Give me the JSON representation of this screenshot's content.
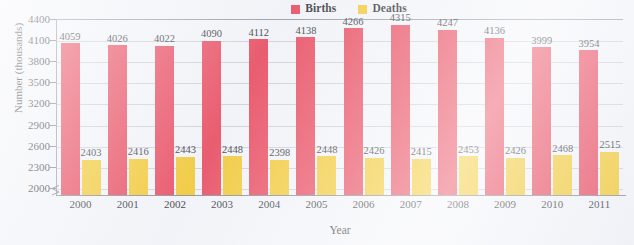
{
  "chart_data": {
    "type": "bar",
    "title": "",
    "xlabel": "Year",
    "ylabel": "Number (thousands)",
    "categories": [
      "2000",
      "2001",
      "2002",
      "2003",
      "2004",
      "2005",
      "2006",
      "2007",
      "2008",
      "2009",
      "2010",
      "2011"
    ],
    "series": [
      {
        "name": "Births",
        "color": "#e8344a",
        "values": [
          4059,
          4026,
          4022,
          4090,
          4112,
          4138,
          4266,
          4315,
          4247,
          4136,
          3999,
          3954
        ]
      },
      {
        "name": "Deaths",
        "color": "#f2c318",
        "values": [
          2403,
          2416,
          2443,
          2448,
          2398,
          2448,
          2426,
          2415,
          2453,
          2426,
          2468,
          2515
        ]
      }
    ],
    "ylim": [
      1900,
      4400
    ],
    "yticks": [
      2000,
      2300,
      2600,
      2900,
      3200,
      3500,
      3800,
      4100,
      4400
    ],
    "ytick_labels": [
      "2000",
      "2300",
      "2600",
      "2900",
      "3200",
      "3500",
      "3800",
      "4100",
      "4400"
    ],
    "grid": true,
    "axis_break": true,
    "legend_position": "top-center",
    "value_labels": true
  },
  "legend": {
    "items": [
      {
        "label": "Births",
        "color": "#e8344a",
        "swatch": "legend-swatch-births"
      },
      {
        "label": "Deaths",
        "color": "#f2c318",
        "swatch": "legend-swatch-deaths"
      }
    ]
  },
  "axes": {
    "y_title": "Number (thousands)",
    "x_title": "Year"
  }
}
